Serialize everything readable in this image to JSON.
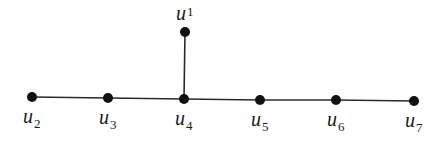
{
  "diagram": {
    "type": "tree-graph",
    "colors": {
      "edge": "#2a2a2a",
      "node": "#111111",
      "label": "#1a1a1a",
      "background": "#ffffff"
    },
    "nodes": [
      {
        "id": "u1",
        "base": "u",
        "sub": "1",
        "x": 185,
        "y": 32,
        "label_pos": "above"
      },
      {
        "id": "u2",
        "base": "u",
        "sub": "2",
        "x": 32,
        "y": 97,
        "label_pos": "below"
      },
      {
        "id": "u3",
        "base": "u",
        "sub": "3",
        "x": 108,
        "y": 98,
        "label_pos": "below"
      },
      {
        "id": "u4",
        "base": "u",
        "sub": "4",
        "x": 184,
        "y": 99,
        "label_pos": "below"
      },
      {
        "id": "u5",
        "base": "u",
        "sub": "5",
        "x": 260,
        "y": 100,
        "label_pos": "below"
      },
      {
        "id": "u6",
        "base": "u",
        "sub": "6",
        "x": 336,
        "y": 100,
        "label_pos": "below"
      },
      {
        "id": "u7",
        "base": "u",
        "sub": "7",
        "x": 414,
        "y": 101,
        "label_pos": "below"
      }
    ],
    "edges": [
      [
        "u1",
        "u4"
      ],
      [
        "u2",
        "u3"
      ],
      [
        "u3",
        "u4"
      ],
      [
        "u4",
        "u5"
      ],
      [
        "u5",
        "u6"
      ],
      [
        "u6",
        "u7"
      ]
    ]
  }
}
